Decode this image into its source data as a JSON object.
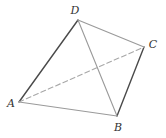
{
  "diagram": {
    "type": "tetrahedron",
    "colors": {
      "dark_edge": "#4a4a4a",
      "light_edge": "#9a9a9a",
      "hidden_edge": "#a8a8a8",
      "label": "#333333"
    },
    "vertices": [
      {
        "id": "A",
        "label": "A",
        "x": 19,
        "y": 102,
        "lx": 11,
        "ly": 107
      },
      {
        "id": "B",
        "label": "B",
        "x": 117,
        "y": 116,
        "lx": 118,
        "ly": 131
      },
      {
        "id": "C",
        "label": "C",
        "x": 144,
        "y": 47,
        "lx": 153,
        "ly": 48
      },
      {
        "id": "D",
        "label": "D",
        "x": 78,
        "y": 20,
        "lx": 75,
        "ly": 14
      }
    ],
    "edges": [
      {
        "from": "A",
        "to": "D",
        "style": "solid",
        "color": "dark_edge"
      },
      {
        "from": "B",
        "to": "C",
        "style": "solid",
        "color": "dark_edge"
      },
      {
        "from": "A",
        "to": "B",
        "style": "solid",
        "color": "light_edge"
      },
      {
        "from": "D",
        "to": "B",
        "style": "solid",
        "color": "light_edge"
      },
      {
        "from": "D",
        "to": "C",
        "style": "solid",
        "color": "light_edge"
      },
      {
        "from": "A",
        "to": "C",
        "style": "dashed",
        "color": "hidden_edge"
      }
    ]
  }
}
